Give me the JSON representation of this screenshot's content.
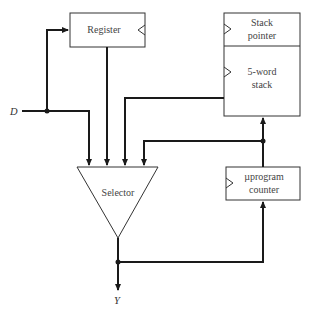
{
  "diagram": {
    "blocks": {
      "register": {
        "label": "Register",
        "clocked": true
      },
      "stack_pointer": {
        "label_line1": "Stack",
        "label_line2": "pointer",
        "clocked": true
      },
      "stack": {
        "label_line1": "5-word",
        "label_line2": "stack",
        "clocked": true
      },
      "selector": {
        "label": "Selector"
      },
      "upc": {
        "label_line1": "µprogram",
        "label_line2": "counter",
        "clocked": true
      }
    },
    "signals": {
      "input": "D",
      "output": "Y"
    },
    "connections": [
      {
        "from": "D",
        "to": "register"
      },
      {
        "from": "D",
        "to": "selector"
      },
      {
        "from": "register",
        "to": "selector"
      },
      {
        "from": "stack",
        "to": "selector"
      },
      {
        "from": "upc",
        "to": "selector"
      },
      {
        "from": "upc",
        "to": "stack"
      },
      {
        "from": "selector",
        "to": "Y"
      },
      {
        "from": "selector",
        "to": "upc"
      }
    ]
  }
}
